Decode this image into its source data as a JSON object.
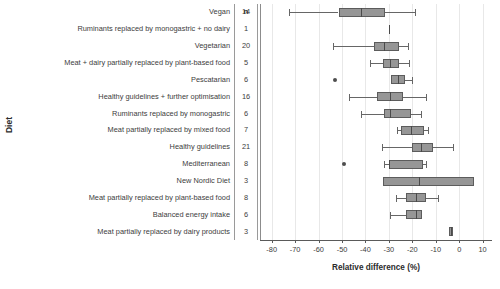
{
  "axis": {
    "y_title": "Diet",
    "x_title": "Relative difference (%)",
    "n_header": "n"
  },
  "chart_data": {
    "type": "box",
    "title": "",
    "xlabel": "Relative difference (%)",
    "ylabel": "Diet",
    "xlim": [
      -85,
      14
    ],
    "xticks": [
      -80,
      -70,
      -60,
      -50,
      -40,
      -30,
      -20,
      -10,
      0,
      10
    ],
    "xticklabels": [
      "-80",
      "-70",
      "-60",
      "-50",
      "-40",
      "-30",
      "-20",
      "-10",
      "0",
      "10"
    ],
    "grid": "vertical",
    "legend": "none",
    "orientation": "horizontal",
    "count_column_header": "n",
    "categories": [
      "Vegan",
      "Ruminants replaced by monogastric + no dairy",
      "Vegetarian",
      "Meat + dairy partially replaced by plant-based food",
      "Pescatarian",
      "Healthy guidelines + further optimisation",
      "Ruminants replaced by monogastric",
      "Meat partially replaced by mixed food",
      "Healthy guidelines",
      "Mediterranean",
      "New Nordic Diet",
      "Meat partially replaced by plant-based food",
      "Balanced energy intake",
      "Meat partially replaced by dairy products"
    ],
    "counts": [
      14,
      1,
      20,
      5,
      6,
      16,
      6,
      7,
      21,
      8,
      3,
      8,
      6,
      3
    ],
    "boxes": [
      {
        "category": "Vegan",
        "n": 14,
        "whisker_low": -72.5,
        "q1": -51.5,
        "median": -42.0,
        "q3": -31.5,
        "whisker_high": -19.0,
        "outliers": []
      },
      {
        "category": "Ruminants replaced by monogastric + no dairy",
        "n": 1,
        "whisker_low": -30.0,
        "q1": -30.0,
        "median": -30.0,
        "q3": -30.0,
        "whisker_high": -30.0,
        "outliers": []
      },
      {
        "category": "Vegetarian",
        "n": 20,
        "whisker_low": -54.0,
        "q1": -36.5,
        "median": -32.0,
        "q3": -25.5,
        "whisker_high": -22.0,
        "outliers": []
      },
      {
        "category": "Meat + dairy partially replaced by plant-based food",
        "n": 5,
        "whisker_low": -38.0,
        "q1": -32.5,
        "median": -29.5,
        "q3": -25.5,
        "whisker_high": -21.5,
        "outliers": []
      },
      {
        "category": "Pescatarian",
        "n": 6,
        "whisker_low": -29.0,
        "q1": -29.0,
        "median": -26.0,
        "q3": -23.0,
        "whisker_high": -20.0,
        "outliers": [
          -53.0
        ]
      },
      {
        "category": "Healthy guidelines + further optimisation",
        "n": 16,
        "whisker_low": -47.0,
        "q1": -35.0,
        "median": -29.5,
        "q3": -24.0,
        "whisker_high": -14.0,
        "outliers": []
      },
      {
        "category": "Ruminants replaced by monogastric",
        "n": 6,
        "whisker_low": -42.0,
        "q1": -32.0,
        "median": -29.5,
        "q3": -20.5,
        "whisker_high": -16.5,
        "outliers": []
      },
      {
        "category": "Meat partially replaced by mixed food",
        "n": 7,
        "whisker_low": -26.5,
        "q1": -25.0,
        "median": -20.5,
        "q3": -15.0,
        "whisker_high": -13.5,
        "outliers": []
      },
      {
        "category": "Healthy guidelines",
        "n": 21,
        "whisker_low": -33.0,
        "q1": -20.0,
        "median": -16.5,
        "q3": -11.0,
        "whisker_high": -2.5,
        "outliers": []
      },
      {
        "category": "Mediterranean",
        "n": 8,
        "whisker_low": -32.0,
        "q1": -30.0,
        "median": -30.0,
        "q3": -15.5,
        "whisker_high": -14.0,
        "outliers": [
          -49.0
        ]
      },
      {
        "category": "New Nordic Diet",
        "n": 3,
        "whisker_low": -32.5,
        "q1": -32.5,
        "median": -17.0,
        "q3": 6.5,
        "whisker_high": 6.5,
        "outliers": []
      },
      {
        "category": "Meat partially replaced by plant-based food",
        "n": 8,
        "whisker_low": -27.0,
        "q1": -22.5,
        "median": -18.5,
        "q3": -14.0,
        "whisker_high": -9.0,
        "outliers": []
      },
      {
        "category": "Balanced energy intake",
        "n": 6,
        "whisker_low": -29.5,
        "q1": -22.5,
        "median": -18.5,
        "q3": -16.0,
        "whisker_high": -16.0,
        "outliers": []
      },
      {
        "category": "Meat partially replaced by dairy products",
        "n": 3,
        "whisker_low": -4.5,
        "q1": -4.5,
        "median": -3.5,
        "q3": -2.5,
        "whisker_high": -2.5,
        "outliers": []
      }
    ]
  }
}
